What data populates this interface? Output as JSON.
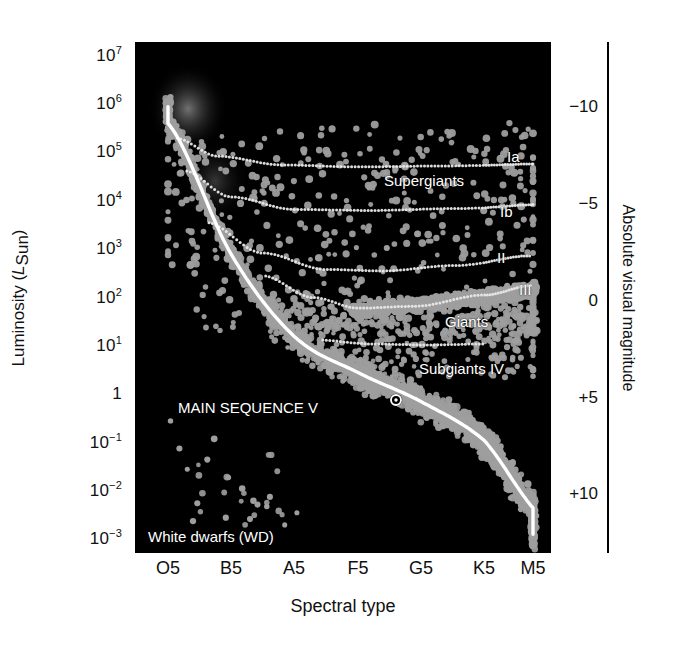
{
  "figure": {
    "kind": "hertzsprung-russell-diagram",
    "background": "#ffffff",
    "plot_background": "#000000"
  },
  "axes": {
    "left": {
      "title_prefix": "Luminosity (",
      "title_symbol": "L",
      "title_subscript": "Sun",
      "title_suffix": ")",
      "scale": "log",
      "ticks": [
        {
          "label": "10",
          "exp": "7",
          "value": 10000000.0
        },
        {
          "label": "10",
          "exp": "6",
          "value": 1000000.0
        },
        {
          "label": "10",
          "exp": "5",
          "value": 100000.0
        },
        {
          "label": "10",
          "exp": "4",
          "value": 10000.0
        },
        {
          "label": "10",
          "exp": "3",
          "value": 1000.0
        },
        {
          "label": "10",
          "exp": "2",
          "value": 100.0
        },
        {
          "label": "10",
          "exp": "1",
          "value": 10.0
        },
        {
          "label": "1",
          "exp": "",
          "value": 1
        },
        {
          "label": "10",
          "exp": "−1",
          "value": 0.1
        },
        {
          "label": "10",
          "exp": "−2",
          "value": 0.01
        },
        {
          "label": "10",
          "exp": "−3",
          "value": 0.001
        }
      ]
    },
    "right": {
      "title": "Absolute visual magnitude",
      "ticks": [
        "−10",
        "−5",
        "0",
        "+5",
        "+10"
      ],
      "tick_values": [
        -10,
        -5,
        0,
        5,
        10
      ]
    },
    "bottom": {
      "title": "Spectral type",
      "ticks": [
        "O5",
        "B5",
        "A5",
        "F5",
        "G5",
        "K5",
        "M5"
      ]
    }
  },
  "annotations": [
    {
      "name": "supergiants-label",
      "text": "Supergiants",
      "x": 384,
      "y": 172
    },
    {
      "name": "class-ia-label",
      "text": "Ia",
      "x": 507,
      "y": 148
    },
    {
      "name": "class-ib-label",
      "text": "Ib",
      "x": 500,
      "y": 203
    },
    {
      "name": "class-ii-label",
      "text": "II",
      "x": 497,
      "y": 249
    },
    {
      "name": "class-iii-label",
      "text": "III",
      "x": 519,
      "y": 281
    },
    {
      "name": "giants-label",
      "text": "Giants",
      "x": 445,
      "y": 313
    },
    {
      "name": "subgiants-label",
      "text": "Subgiants IV",
      "x": 419,
      "y": 360
    },
    {
      "name": "main-sequence-label",
      "text": "MAIN SEQUENCE V",
      "x": 178,
      "y": 399
    },
    {
      "name": "white-dwarfs-label",
      "text": "White dwarfs (WD)",
      "x": 148,
      "y": 528
    }
  ],
  "markers": {
    "sun": {
      "name": "sun-symbol",
      "x": 396,
      "y": 400,
      "glyph": "☉"
    }
  },
  "chart_data": {
    "type": "scatter",
    "title": "",
    "xlabel": "Spectral type",
    "ylabel": "Luminosity (L_Sun)",
    "y2label": "Absolute visual magnitude",
    "xticklabels": [
      "O5",
      "B5",
      "A5",
      "F5",
      "G5",
      "K5",
      "M5"
    ],
    "yticklabels": [
      "10^7",
      "10^6",
      "10^5",
      "10^4",
      "10^3",
      "10^2",
      "10^1",
      "1",
      "10^-1",
      "10^-2",
      "10^-3"
    ],
    "ylim": [
      0.001,
      10000000
    ],
    "y2lim": [
      13,
      -11
    ],
    "grid": false,
    "legend": false,
    "point_color": "#9a9a9a",
    "main_sequence_curve_color": "#ffffff",
    "luminosity_class_curve_style": "dotted white",
    "series": [
      {
        "name": "Main sequence V",
        "description": "dense diagonal band from upper-left (hot, luminous) to lower-right (cool, faint)"
      },
      {
        "name": "Giants III",
        "description": "clump near L = 100 L_Sun spanning G5 to M5"
      },
      {
        "name": "Supergiants Ia / Ib",
        "description": "sparse scatter near L = 10^4 to 10^5 L_Sun across all spectral types"
      },
      {
        "name": "White dwarfs WD",
        "description": "sparse scatter near L = 10^-2 to 10^-3 L_Sun at left of diagram"
      }
    ],
    "luminosity_classes": [
      {
        "label": "Ia",
        "approx_luminosity": 50000
      },
      {
        "label": "Ib",
        "approx_luminosity": 8000
      },
      {
        "label": "II",
        "approx_luminosity": 1200
      },
      {
        "label": "III",
        "approx_luminosity": 300
      },
      {
        "label": "IV",
        "approx_luminosity": 15
      }
    ]
  }
}
